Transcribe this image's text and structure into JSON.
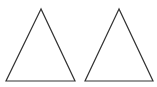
{
  "canvas": {
    "width": 157,
    "height": 87,
    "background": "#ffffff"
  },
  "shapes": [
    {
      "type": "triangle",
      "name": "left-triangle",
      "points": [
        [
          41,
          9
        ],
        [
          6,
          81
        ],
        [
          75,
          81
        ]
      ],
      "stroke": "#333333",
      "stroke_width": 1.2,
      "fill": "none"
    },
    {
      "type": "triangle",
      "name": "right-triangle",
      "points": [
        [
          119,
          9
        ],
        [
          85,
          81
        ],
        [
          153,
          81
        ]
      ],
      "stroke": "#333333",
      "stroke_width": 1.2,
      "fill": "none"
    }
  ]
}
